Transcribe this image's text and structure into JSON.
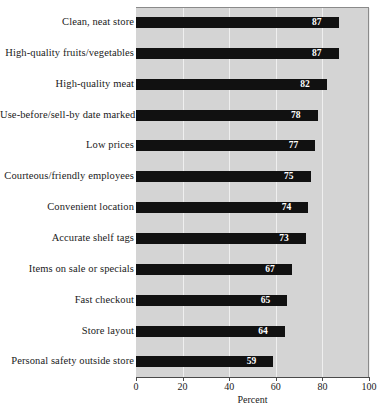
{
  "chart_data": {
    "type": "bar",
    "orientation": "horizontal",
    "title": "",
    "xlabel": "Percent",
    "ylabel": "",
    "xlim": [
      0,
      100
    ],
    "xticks": [
      0,
      20,
      40,
      60,
      80,
      100
    ],
    "xtick_labels": [
      "0",
      "20",
      "40",
      "60",
      "80",
      "100"
    ],
    "grid": true,
    "grid_axis": "x",
    "legend": false,
    "categories": [
      "Clean, neat store",
      "High-quality fruits/vegetables",
      "High-quality meat",
      "Use-before/sell-by date marked",
      "Low prices",
      "Courteous/friendly employees",
      "Convenient location",
      "Accurate shelf tags",
      "Items on sale or specials",
      "Fast checkout",
      "Store layout",
      "Personal safety outside store"
    ],
    "values": [
      87,
      87,
      82,
      78,
      77,
      75,
      74,
      73,
      67,
      65,
      64,
      59
    ],
    "value_labels": [
      "87",
      "87",
      "82",
      "78",
      "77",
      "75",
      "74",
      "73",
      "67",
      "65",
      "64",
      "59"
    ],
    "colors": {
      "bar": "#111111",
      "plot_background": "#d4d4d4",
      "gridline": "#efefef",
      "axis": "#4a4a4a",
      "value_label": "#ffffff",
      "text": "#1a1a1a"
    }
  }
}
